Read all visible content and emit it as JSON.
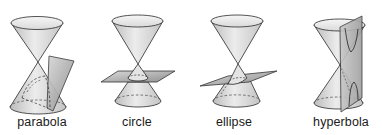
{
  "figures": [
    {
      "id": "parabola",
      "label": "parabola",
      "label_x": 42
    },
    {
      "id": "circle",
      "label": "circle",
      "label_x": 137
    },
    {
      "id": "ellipse",
      "label": "ellipse",
      "label_x": 234
    },
    {
      "id": "hyperbola",
      "label": "hyperbola",
      "label_x": 341
    }
  ],
  "colors": {
    "background": "#ffffff",
    "cone_light": "#eeeeee",
    "cone_mid": "#d2d2d2",
    "cone_dark": "#b4b4b4",
    "plane_light": "#cfcfcf",
    "plane_dark": "#8f8f8f",
    "outline": "#2a2a2a",
    "label": "#1a1a1a"
  }
}
